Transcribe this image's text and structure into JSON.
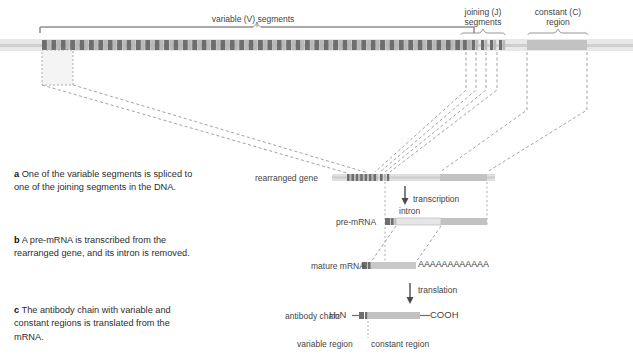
{
  "figure": {
    "top_labels": {
      "variable": "variable (V) segments",
      "joining_line1": "joining (J)",
      "joining_line2": "segments",
      "constant_line1": "constant (C)",
      "constant_line2": "region"
    },
    "steps": [
      {
        "marker": "a",
        "text": "One of the variable segments is spliced to one of the joining segments in the DNA."
      },
      {
        "marker": "b",
        "text": "A pre-mRNA is transcribed from the rearranged gene, and its intron is removed."
      },
      {
        "marker": "c",
        "text": "The antibody chain with variable and constant regions is translated from the mRNA."
      }
    ],
    "rows": {
      "rearranged_gene": "rearranged gene",
      "pre_mrna": "pre-mRNA",
      "mature_mrna": "mature mRNA",
      "antibody_chain": "antibody chain"
    },
    "annotations": {
      "transcription": "transcription",
      "translation": "translation",
      "intron": "intron",
      "poly_a": "AAAAAAAAAAAA",
      "n_terminus_pre": "H",
      "n_terminus_sub": "2",
      "n_terminus_post": "N",
      "c_terminus": "COOH",
      "variable_region": "variable region",
      "constant_region": "constant region"
    },
    "colors": {
      "background": "#ffffff",
      "dna_backbone": "#d8d8d8",
      "segment_dark": "#6e6e6e",
      "segment_light": "#b9b9b9",
      "constant_block": "#c2c2c2",
      "dashed_line": "#8a8a8a",
      "text": "#3a3a3a",
      "highlight_fill": "#f2f2f2"
    },
    "counts": {
      "v_segments": 46,
      "j_segments": 5
    }
  }
}
